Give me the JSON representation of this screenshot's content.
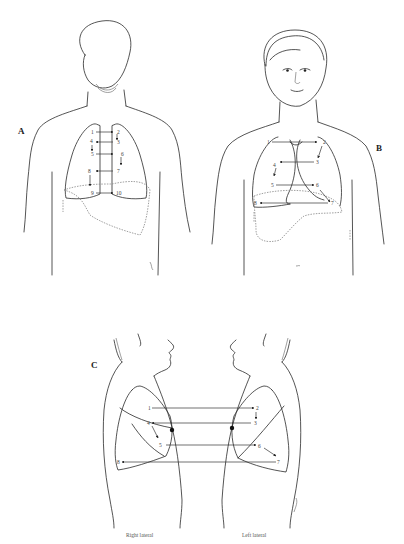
{
  "figure": {
    "panels": [
      {
        "id": "A",
        "label": "A",
        "view": "posterior",
        "points": [
          "1",
          "2",
          "3",
          "4",
          "5",
          "6",
          "7",
          "8",
          "9",
          "10"
        ]
      },
      {
        "id": "B",
        "label": "B",
        "view": "anterior",
        "points": [
          "1",
          "2",
          "3",
          "4",
          "5",
          "6",
          "7",
          "8"
        ]
      },
      {
        "id": "C",
        "label": "C",
        "view": "lateral",
        "points": [
          "1",
          "2",
          "3",
          "4",
          "5",
          "6",
          "7",
          "8"
        ],
        "captions": {
          "right": "Right lateral",
          "left": "Left lateral"
        }
      }
    ]
  },
  "colors": {
    "line": "#2a2a2a",
    "organ": "#888888",
    "background": "#ffffff"
  }
}
